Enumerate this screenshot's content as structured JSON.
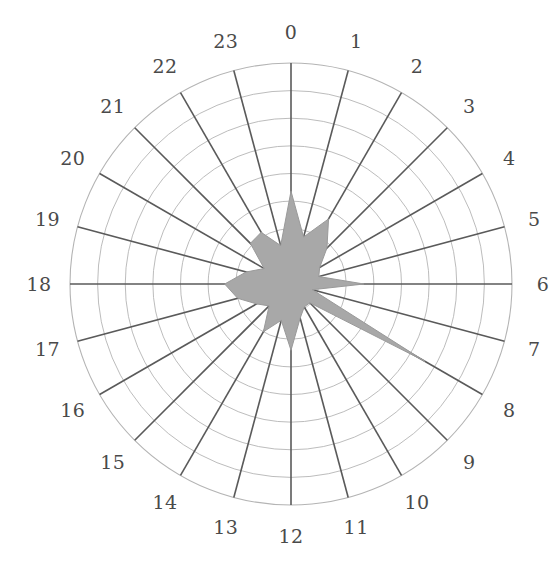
{
  "chart_data": {
    "type": "line",
    "subtype": "polar-area-filled",
    "title": "",
    "subtitle": "",
    "xlabel": "",
    "ylabel": "",
    "categories": [
      "0",
      "1",
      "2",
      "3",
      "4",
      "5",
      "6",
      "7",
      "8",
      "9",
      "10",
      "11",
      "12",
      "13",
      "14",
      "15",
      "16",
      "17",
      "18",
      "19",
      "20",
      "21",
      "22",
      "23"
    ],
    "values": [
      0.42,
      0.22,
      0.34,
      0.23,
      0.15,
      0.13,
      0.33,
      0.1,
      0.7,
      0.12,
      0.12,
      0.16,
      0.3,
      0.17,
      0.25,
      0.14,
      0.18,
      0.25,
      0.3,
      0.21,
      0.14,
      0.26,
      0.27,
      0.18
    ],
    "rlim": [
      0,
      1
    ],
    "n_rings": 8,
    "n_spokes": 24,
    "angular_start": "top",
    "angular_direction": "clockwise",
    "grid": true,
    "legend": "none",
    "tick_labels_visible": true,
    "radial_tick_labels": [],
    "colors": {
      "fill": "#a8a8a8",
      "fill_stroke": "#9a9a9a",
      "spoke": "#5a5a5a",
      "ring": "#b4b4b4",
      "label": "#4a4a4a",
      "background": "#ffffff"
    },
    "geometry": {
      "center_x": 291,
      "center_y": 284,
      "outer_radius": 221,
      "label_radius": 252
    }
  },
  "labels": {
    "tick_0": "0",
    "tick_1": "1",
    "tick_2": "2",
    "tick_3": "3",
    "tick_4": "4",
    "tick_5": "5",
    "tick_6": "6",
    "tick_7": "7",
    "tick_8": "8",
    "tick_9": "9",
    "tick_10": "10",
    "tick_11": "11",
    "tick_12": "12",
    "tick_13": "13",
    "tick_14": "14",
    "tick_15": "15",
    "tick_16": "16",
    "tick_17": "17",
    "tick_18": "18",
    "tick_19": "19",
    "tick_20": "20",
    "tick_21": "21",
    "tick_22": "22",
    "tick_23": "23"
  }
}
